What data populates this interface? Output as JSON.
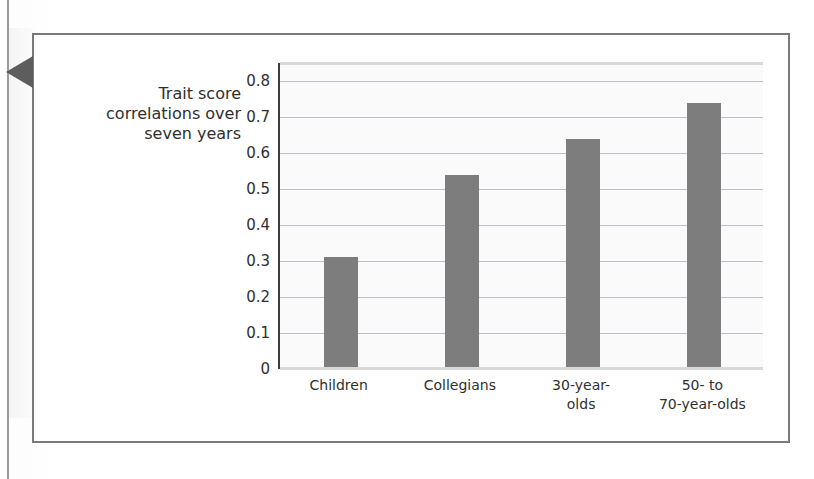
{
  "figure": {
    "pointer_icon": "left-arrow-marker",
    "title_lines": [
      "Trait score",
      "correlations over",
      "seven years"
    ]
  },
  "chart_data": {
    "type": "bar",
    "xlabel": "",
    "ylabel": "Trait score correlations over seven years",
    "categories": [
      "Children",
      "Collegians",
      "30-year-olds",
      "50- to 70-year-olds"
    ],
    "category_label_lines": [
      [
        "Children"
      ],
      [
        "Collegians"
      ],
      [
        "30-year-",
        "olds"
      ],
      [
        "50- to",
        "70-year-olds"
      ]
    ],
    "values": [
      0.31,
      0.54,
      0.64,
      0.74
    ],
    "ylim": [
      0,
      0.85
    ],
    "yticks": [
      "0",
      "0.1",
      "0.2",
      "0.3",
      "0.4",
      "0.5",
      "0.6",
      "0.7",
      "0.8"
    ],
    "ytick_values": [
      0,
      0.1,
      0.2,
      0.3,
      0.4,
      0.5,
      0.6,
      0.7,
      0.8
    ],
    "grid": true,
    "legend": "none",
    "colors": {
      "bar": "#7d7d7d",
      "plot_background": "#fafafa",
      "gridline": "#b9bfc4",
      "axis": "#3d3d3d",
      "frame": "#7a7a7a",
      "text": "#2f2f2f",
      "pointer": "#5d5d5d"
    }
  }
}
